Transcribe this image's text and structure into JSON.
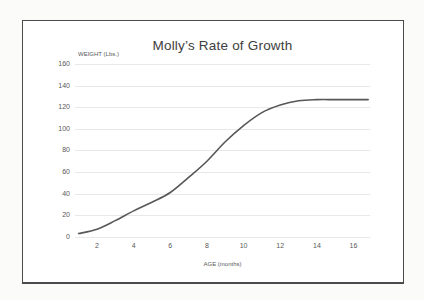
{
  "chart": {
    "colors": {
      "line": "#575757",
      "grid": "#e8e8e8",
      "tick_text": "#595959",
      "title_text": "#3d3d3d",
      "frame_border": "#4b4b4b",
      "frame_background": "#ffffff",
      "page_background": "#fbfbfa"
    }
  },
  "chart_data": {
    "type": "line",
    "title": "Molly’s Rate of Growth",
    "xlabel": "AGE (months)",
    "ylabel": "WEIGHT (Lbs.)",
    "x": [
      1,
      2,
      3,
      4,
      5,
      6,
      7,
      8,
      9,
      10,
      11,
      12,
      13,
      14,
      15,
      16,
      16.8
    ],
    "y": [
      3,
      7,
      15,
      24,
      32,
      41,
      55,
      70,
      88,
      103,
      115,
      122,
      126,
      127,
      127,
      127,
      127
    ],
    "x_ticks": [
      2,
      4,
      6,
      8,
      10,
      12,
      14,
      16
    ],
    "y_ticks": [
      0,
      20,
      40,
      60,
      80,
      100,
      120,
      140,
      160
    ],
    "xlim": [
      0.8,
      16.9
    ],
    "ylim": [
      0,
      160
    ],
    "grid": "horizontal",
    "legend": "none",
    "series_count": 1
  }
}
